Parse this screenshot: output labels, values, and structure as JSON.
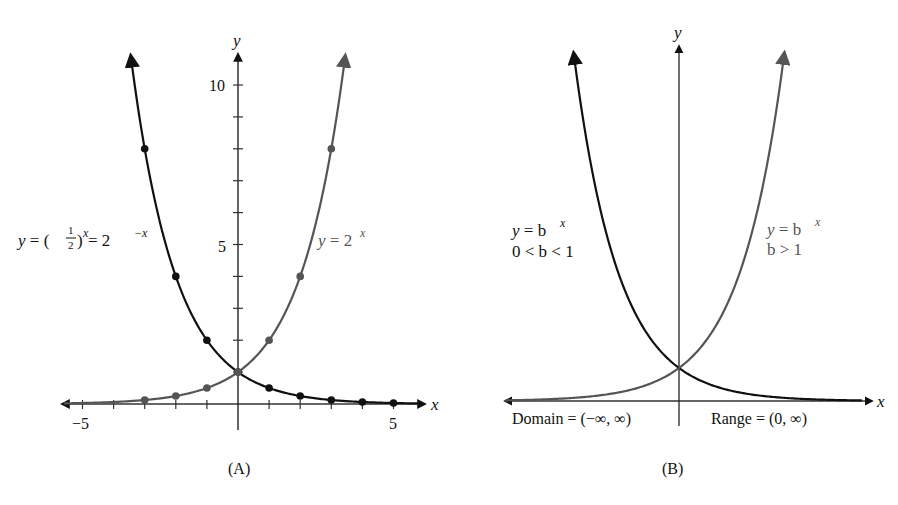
{
  "chart_data": [
    {
      "panel": "A",
      "type": "line",
      "caption": "(A)",
      "xlabel": "x",
      "ylabel": "y",
      "xlim": [
        -5.5,
        6
      ],
      "ylim": [
        0,
        11
      ],
      "x_tick_labels": [
        "-5",
        "5"
      ],
      "y_tick_labels": [
        "5",
        "10"
      ],
      "x_ticks": [
        -5,
        -4,
        -3,
        -2,
        -1,
        0,
        1,
        2,
        3,
        4,
        5
      ],
      "y_ticks": [
        1,
        2,
        3,
        4,
        5,
        6,
        7,
        8,
        9,
        10
      ],
      "grid": false,
      "series": [
        {
          "name": "y = (1/2)^x = 2^-x",
          "label": "y = (½)^x = 2^−x",
          "color": "#111111",
          "points_x": [
            -3,
            -2,
            -1,
            0,
            1,
            2,
            3,
            4,
            5
          ],
          "points_y": [
            8,
            4,
            2,
            1,
            0.5,
            0.25,
            0.125,
            0.0625,
            0.03125
          ]
        },
        {
          "name": "y = 2^x",
          "label": "y = 2^x",
          "color": "#555555",
          "points_x": [
            -3,
            -2,
            -1,
            0,
            1,
            2,
            3
          ],
          "points_y": [
            0.125,
            0.25,
            0.5,
            1,
            2,
            4,
            8
          ]
        }
      ]
    },
    {
      "panel": "B",
      "type": "line",
      "caption": "(B)",
      "xlabel": "x",
      "ylabel": "y",
      "grid": false,
      "series": [
        {
          "name": "y = b^x, 0 < b < 1",
          "color": "#111111"
        },
        {
          "name": "y = b^x, b > 1",
          "color": "#555555"
        }
      ],
      "annotations": [
        "Domain = (−∞, ∞)",
        "Range = (0, ∞)"
      ]
    }
  ],
  "panelA": {
    "caption": "(A)",
    "x_axis_label": "x",
    "y_axis_label": "y",
    "tick_neg5": "−5",
    "tick_5x": "5",
    "tick_5y": "5",
    "tick_10y": "10",
    "decay_label_prefix": "y = (",
    "decay_label_num": "1",
    "decay_label_den": "2",
    "decay_label_mid": ")",
    "decay_label_exp1": "x",
    "decay_label_eq": " = 2",
    "decay_label_exp2": "−x",
    "growth_label_base": "y = 2",
    "growth_label_exp": "x"
  },
  "panelB": {
    "caption": "(B)",
    "x_axis_label": "x",
    "y_axis_label": "y",
    "left_label_line1_base": "y = b",
    "left_label_line1_exp": "x",
    "left_label_line2": "0 < b < 1",
    "right_label_line1_base": "y = b",
    "right_label_line1_exp": "x",
    "right_label_line2": "b > 1",
    "domain_text": "Domain = (−∞, ∞)",
    "range_text": "Range = (0, ∞)"
  }
}
